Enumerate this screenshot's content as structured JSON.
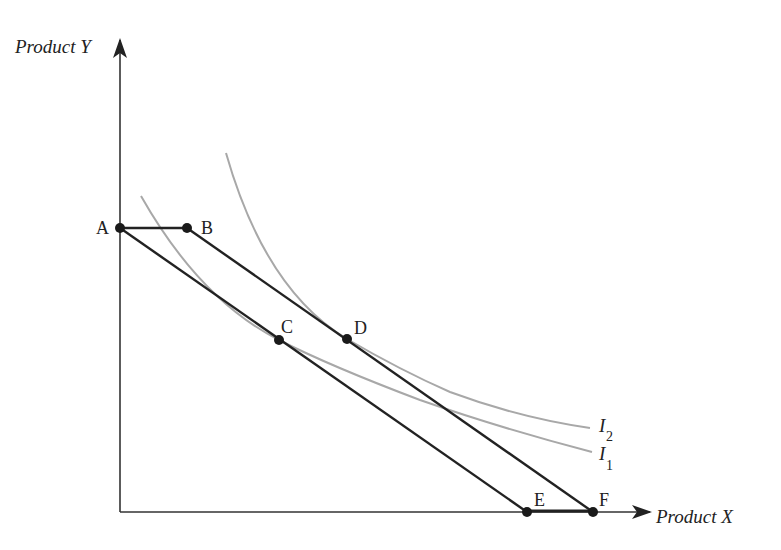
{
  "diagram": {
    "type": "indifference-curve-budget-constraint",
    "axes": {
      "y_label": "Product Y",
      "x_label": "Product X"
    },
    "points": {
      "A": "A",
      "B": "B",
      "C": "C",
      "D": "D",
      "E": "E",
      "F": "F"
    },
    "curves": {
      "i1_label": "I",
      "i1_sub": "1",
      "i2_label": "I",
      "i2_sub": "2"
    },
    "lines": [
      {
        "name": "budget-line-AE",
        "from": "A",
        "to": "E"
      },
      {
        "name": "budget-line-BF",
        "from": "B",
        "to": "F"
      },
      {
        "name": "segment-AB",
        "from": "A",
        "to": "B"
      },
      {
        "name": "segment-EF",
        "from": "E",
        "to": "F"
      }
    ],
    "colors": {
      "axis": "#333333",
      "budget_line": "#222222",
      "indifference_curve": "#a8a8a8",
      "point": "#1a1a1a"
    }
  }
}
